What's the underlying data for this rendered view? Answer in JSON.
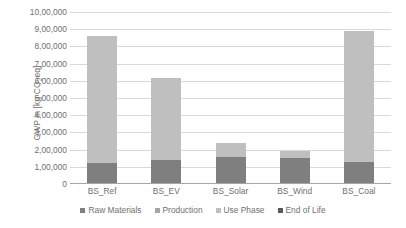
{
  "chart_data": {
    "type": "bar",
    "stacked": true,
    "title": "",
    "xlabel": "",
    "ylabel": "GWP in [kg CO2eq]",
    "ylabel_prefix": "GWP in [kg CO",
    "ylabel_sub": "2",
    "ylabel_suffix": "eq]",
    "categories": [
      "BS_Ref",
      "BS_EV",
      "BS_Solar",
      "BS_Wind",
      "BS_Coal"
    ],
    "series": [
      {
        "name": "Raw Materials",
        "color": "#7f7f7f",
        "values": [
          125000,
          140000,
          155000,
          150000,
          130000
        ]
      },
      {
        "name": "Production",
        "color": "#a5a5a5",
        "values": [
          0,
          0,
          0,
          0,
          0
        ]
      },
      {
        "name": "Use Phase",
        "color": "#bfbfbf",
        "values": [
          735000,
          475000,
          85000,
          40000,
          760000
        ]
      },
      {
        "name": "End of Life",
        "color": "#595959",
        "values": [
          0,
          0,
          0,
          0,
          0
        ]
      }
    ],
    "totals": [
      860000,
      615000,
      240000,
      190000,
      890000
    ],
    "ylim": [
      0,
      1000000
    ],
    "ytick_values": [
      0,
      100000,
      200000,
      300000,
      400000,
      500000,
      600000,
      700000,
      800000,
      900000,
      1000000
    ],
    "ytick_labels": [
      "0",
      "1,00,000",
      "2,00,000",
      "3,00,000",
      "4,00,000",
      "5,00,000",
      "6,00,000",
      "7,00,000",
      "8,00,000",
      "9,00,000",
      "10,00,000"
    ],
    "grid": true,
    "grid_axis": "y",
    "grid_color": "#d9d9d9",
    "axis_color": "#a6a6a6",
    "text_color": "#6f6f6f",
    "legend_position": "bottom",
    "legend": [
      "Raw Materials",
      "Production",
      "Use Phase",
      "End of Life"
    ]
  }
}
